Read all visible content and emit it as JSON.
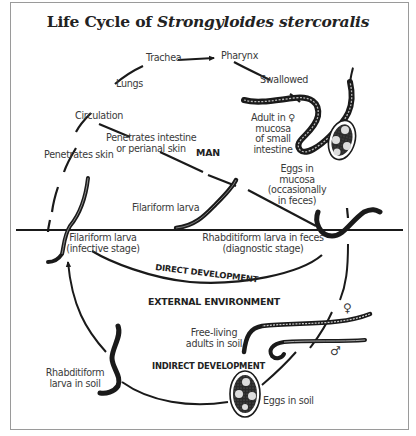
{
  "title": {
    "prefix": "Life Cycle of ",
    "species": "Strongyloides stercoralis"
  },
  "regions": {
    "host": "MAN",
    "external": "EXTERNAL ENVIRONMENT"
  },
  "pathways": {
    "direct": "DIRECT DEVELOPMENT",
    "indirect": "INDIRECT DEVELOPMENT"
  },
  "stages": {
    "trachea": "Trachea",
    "pharynx": "Pharynx",
    "lungs": "Lungs",
    "swallowed": "Swallowed",
    "circulation": "Circulation",
    "penetrates_intestine_1": "Penetrates intestine",
    "penetrates_intestine_2": "or perianal skin",
    "penetrates_skin": "Penetrates skin",
    "adult_1": "Adult in",
    "adult_female_symbol": "♀",
    "adult_2": "mucosa",
    "adult_3": "of small",
    "adult_4": "intestine",
    "eggs_mucosa_1": "Eggs in",
    "eggs_mucosa_2": "mucosa",
    "eggs_mucosa_3": "(occasionally",
    "eggs_mucosa_4": "in feces)",
    "filariform_larva": "Filariform larva",
    "filariform_infective_1": "Filariform larva",
    "filariform_infective_2": "(infective stage)",
    "rhabditiform_feces_1": "Rhabditiform larva in feces",
    "rhabditiform_feces_2": "(diagnostic stage)",
    "free_living_1": "Free-living",
    "free_living_2": "adults in soil",
    "female_symbol": "♀",
    "male_symbol": "♂",
    "rhabditiform_soil_1": "Rhabditiform",
    "rhabditiform_soil_2": "larva in soil",
    "eggs_soil": "Eggs in soil"
  },
  "colors": {
    "ink": "#1a1a1a",
    "text": "#3a3a3a",
    "frame": "#9a9a9a",
    "background": "#ffffff"
  }
}
